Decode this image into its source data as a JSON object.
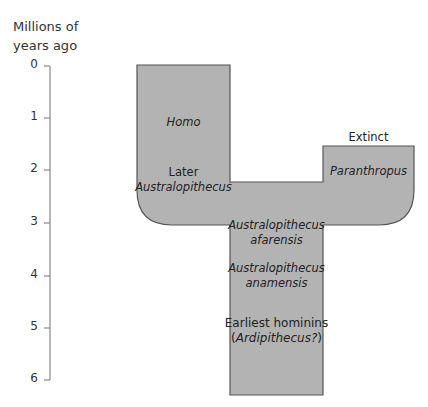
{
  "axis": {
    "title_line1": "Millions of",
    "title_line2": "years ago",
    "ticks": [
      "0",
      "1",
      "2",
      "3",
      "4",
      "5",
      "6"
    ]
  },
  "diagram": {
    "fill_color": "#b3b3b3",
    "stroke_color": "#555555",
    "labels": {
      "homo": "Homo",
      "later_line1": "Later",
      "later_line2": "Australopithecus",
      "extinct": "Extinct",
      "paranthropus": "Paranthropus",
      "afarensis_line1": "Australopithecus",
      "afarensis_line2": "afarensis",
      "anamensis_line1": "Australopithecus",
      "anamensis_line2": "anamensis",
      "earliest_line1": "Earliest hominins",
      "earliest_line2_open": "(",
      "earliest_line2_italic": "Ardipithecus?",
      "earliest_line2_close": ")"
    }
  }
}
